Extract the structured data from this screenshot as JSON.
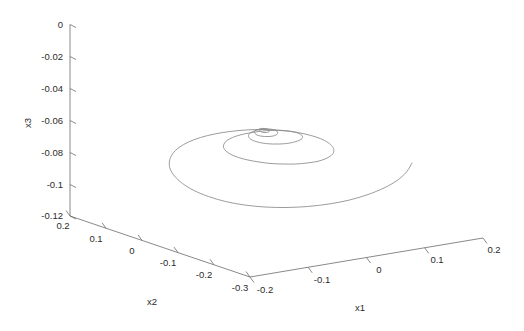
{
  "figure": {
    "type": "3d-line-plot",
    "background_color": "#ffffff",
    "curve_color": "#8a8a8a",
    "axis_color": "#6b6b6b",
    "text_color": "#2b2b2b"
  },
  "axes": {
    "x1": {
      "label": "x1",
      "ticks": [
        "-0.2",
        "-0.1",
        "0",
        "0.1",
        "0.2"
      ],
      "range": [
        -0.2,
        0.2
      ]
    },
    "x2": {
      "label": "x2",
      "ticks": [
        "0.2",
        "0.1",
        "0",
        "-0.1",
        "-0.2",
        "-0.3"
      ],
      "range": [
        -0.3,
        0.2
      ]
    },
    "x3": {
      "label": "x3",
      "ticks": [
        "0",
        "-0.02",
        "-0.04",
        "-0.06",
        "-0.08",
        "-0.1",
        "-0.12"
      ],
      "range": [
        -0.12,
        0
      ]
    }
  },
  "chart_data": {
    "type": "line",
    "title": "",
    "xlabel": "x1",
    "ylabel": "x2",
    "zlabel": "x3",
    "xlim": [
      -0.2,
      0.2
    ],
    "ylim": [
      -0.3,
      0.2
    ],
    "zlim": [
      -0.12,
      0.0
    ],
    "grid": false,
    "legend": null,
    "series": [
      {
        "name": "trajectory",
        "color": "#8a8a8a",
        "points_screen": [
          [
            412.0,
            163.0
          ],
          [
            406.5,
            172.0
          ],
          [
            397.0,
            180.5
          ],
          [
            384.0,
            188.0
          ],
          [
            368.0,
            194.5
          ],
          [
            349.5,
            200.0
          ],
          [
            329.0,
            204.0
          ],
          [
            307.5,
            206.5
          ],
          [
            286.0,
            207.5
          ],
          [
            265.0,
            207.0
          ],
          [
            244.5,
            205.0
          ],
          [
            225.5,
            201.5
          ],
          [
            208.5,
            196.5
          ],
          [
            194.0,
            190.5
          ],
          [
            182.5,
            183.5
          ],
          [
            174.5,
            176.0
          ],
          [
            170.0,
            168.5
          ],
          [
            169.5,
            161.0
          ],
          [
            172.5,
            154.0
          ],
          [
            179.0,
            147.5
          ],
          [
            188.5,
            142.0
          ],
          [
            200.5,
            137.5
          ],
          [
            214.5,
            134.0
          ],
          [
            230.0,
            131.5
          ],
          [
            246.0,
            130.0
          ],
          [
            262.0,
            129.5
          ],
          [
            277.5,
            130.0
          ],
          [
            292.0,
            131.5
          ],
          [
            305.0,
            134.0
          ],
          [
            316.0,
            137.0
          ],
          [
            324.5,
            140.5
          ],
          [
            330.5,
            144.5
          ],
          [
            333.5,
            148.5
          ],
          [
            333.5,
            152.5
          ],
          [
            330.5,
            156.0
          ],
          [
            325.0,
            159.0
          ],
          [
            317.0,
            161.5
          ],
          [
            307.0,
            163.0
          ],
          [
            295.5,
            164.0
          ],
          [
            283.5,
            164.0
          ],
          [
            271.0,
            163.5
          ],
          [
            259.0,
            162.0
          ],
          [
            248.0,
            160.0
          ],
          [
            238.5,
            157.5
          ],
          [
            231.0,
            154.5
          ],
          [
            226.0,
            151.0
          ],
          [
            223.5,
            147.5
          ],
          [
            224.0,
            144.0
          ],
          [
            227.0,
            140.5
          ],
          [
            232.5,
            137.5
          ],
          [
            240.0,
            135.0
          ],
          [
            249.0,
            133.0
          ],
          [
            259.0,
            131.5
          ],
          [
            269.0,
            130.5
          ],
          [
            278.5,
            130.5
          ],
          [
            287.0,
            131.0
          ],
          [
            294.0,
            132.0
          ],
          [
            299.0,
            133.5
          ],
          [
            302.0,
            135.5
          ],
          [
            302.5,
            137.5
          ],
          [
            301.0,
            139.5
          ],
          [
            297.5,
            141.0
          ],
          [
            292.5,
            142.5
          ],
          [
            286.5,
            143.5
          ],
          [
            279.5,
            144.0
          ],
          [
            272.5,
            144.0
          ],
          [
            265.5,
            143.5
          ],
          [
            259.5,
            142.5
          ],
          [
            254.5,
            141.0
          ],
          [
            251.0,
            139.5
          ],
          [
            249.0,
            137.5
          ],
          [
            248.5,
            135.5
          ],
          [
            249.5,
            133.5
          ],
          [
            252.0,
            132.0
          ],
          [
            255.5,
            130.5
          ],
          [
            260.0,
            129.5
          ],
          [
            264.5,
            129.0
          ],
          [
            269.0,
            129.0
          ],
          [
            273.0,
            129.5
          ],
          [
            276.0,
            130.5
          ],
          [
            277.5,
            132.0
          ],
          [
            277.5,
            133.5
          ],
          [
            276.0,
            135.0
          ],
          [
            273.0,
            136.0
          ],
          [
            269.0,
            136.5
          ],
          [
            264.5,
            136.5
          ],
          [
            260.5,
            136.0
          ],
          [
            257.0,
            135.0
          ],
          [
            255.0,
            133.5
          ],
          [
            254.5,
            132.0
          ],
          [
            255.5,
            130.5
          ],
          [
            258.0,
            129.5
          ],
          [
            261.0,
            128.5
          ],
          [
            264.5,
            128.5
          ],
          [
            267.5,
            129.0
          ],
          [
            269.0,
            130.0
          ],
          [
            269.5,
            131.0
          ],
          [
            268.5,
            132.0
          ],
          [
            266.5,
            132.5
          ],
          [
            264.0,
            132.5
          ],
          [
            261.5,
            132.0
          ],
          [
            260.0,
            131.0
          ],
          [
            259.5,
            130.0
          ],
          [
            260.5,
            129.5
          ],
          [
            262.5,
            129.0
          ],
          [
            264.5,
            129.0
          ],
          [
            266.0,
            129.5
          ]
        ]
      }
    ]
  }
}
